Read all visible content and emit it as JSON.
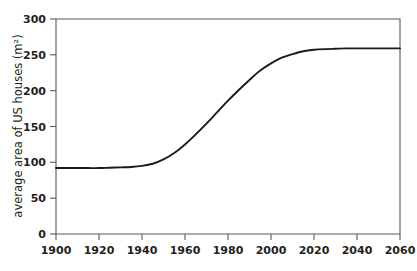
{
  "chart_data": {
    "type": "line",
    "title": "",
    "xlabel": "",
    "ylabel": "average area of US houses (m²)",
    "xlim": [
      1900,
      2060
    ],
    "ylim": [
      0,
      300
    ],
    "grid": false,
    "legend": null,
    "x_ticks": [
      1900,
      1920,
      1940,
      1960,
      1980,
      2000,
      2020,
      2040,
      2060
    ],
    "x_tick_labels": [
      "1900",
      "1920",
      "1940",
      "1960",
      "1980",
      "2000",
      "2020",
      "2040",
      "2060"
    ],
    "y_ticks": [
      0,
      50,
      100,
      150,
      200,
      250,
      300
    ],
    "y_tick_labels": [
      "0",
      "50",
      "100",
      "150",
      "200",
      "250",
      "300"
    ],
    "series": [
      {
        "name": "average area of US houses",
        "color": "#1a1a1a",
        "x": [
          1900,
          1905,
          1910,
          1915,
          1920,
          1925,
          1930,
          1935,
          1940,
          1945,
          1950,
          1955,
          1960,
          1965,
          1970,
          1975,
          1980,
          1985,
          1990,
          1995,
          2000,
          2005,
          2010,
          2015,
          2020,
          2025,
          2030,
          2035,
          2040,
          2045,
          2050,
          2055,
          2060
        ],
        "y": [
          92,
          92,
          92,
          92,
          92,
          92.5,
          93,
          93.5,
          95,
          98,
          104,
          113,
          125,
          139,
          154,
          170,
          186,
          201,
          215,
          228,
          238,
          246,
          251,
          255,
          257,
          258,
          258.5,
          259,
          259,
          259,
          259,
          259,
          259
        ]
      }
    ],
    "notes": {
      "start_value": 92,
      "plateau_value": 259,
      "shape": "logistic S-curve"
    }
  },
  "axis": {
    "y_title": "average area of US houses (m²)"
  }
}
